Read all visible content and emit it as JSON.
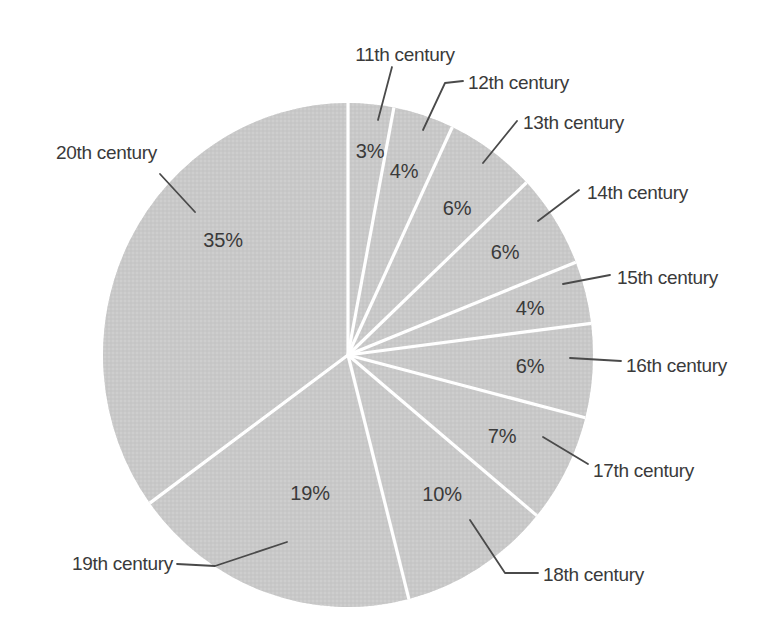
{
  "chart_data": {
    "type": "pie",
    "value_unit": "percent",
    "total": 100,
    "categories": [
      "11th century",
      "12th century",
      "13th century",
      "14th century",
      "15th century",
      "16th century",
      "17th century",
      "18th century",
      "19th century",
      "20th century"
    ],
    "values": [
      3,
      4,
      6,
      6,
      4,
      6,
      7,
      10,
      19,
      35
    ],
    "slices": [
      {
        "label": "11th century",
        "value": 3,
        "pct_text": "3%",
        "pct_pos": {
          "x": 370,
          "y": 151
        },
        "label_pos": {
          "x": 405,
          "y": 54,
          "anchor": "middle"
        },
        "leader": [
          [
            392,
            67
          ],
          [
            378,
            120
          ]
        ]
      },
      {
        "label": "12th century",
        "value": 4,
        "pct_text": "4%",
        "pct_pos": {
          "x": 404,
          "y": 171
        },
        "label_pos": {
          "x": 468,
          "y": 82,
          "anchor": "start"
        },
        "leader": [
          [
            463,
            81
          ],
          [
            445,
            83
          ],
          [
            423,
            130
          ]
        ]
      },
      {
        "label": "13th century",
        "value": 6,
        "pct_text": "6%",
        "pct_pos": {
          "x": 457,
          "y": 208
        },
        "label_pos": {
          "x": 523,
          "y": 122,
          "anchor": "start"
        },
        "leader": [
          [
            517,
            121
          ],
          [
            483,
            163
          ]
        ]
      },
      {
        "label": "14th century",
        "value": 6,
        "pct_text": "6%",
        "pct_pos": {
          "x": 505,
          "y": 252
        },
        "label_pos": {
          "x": 587,
          "y": 192,
          "anchor": "start"
        },
        "leader": [
          [
            579,
            190
          ],
          [
            538,
            221
          ]
        ]
      },
      {
        "label": "15th century",
        "value": 4,
        "pct_text": "4%",
        "pct_pos": {
          "x": 530,
          "y": 308
        },
        "label_pos": {
          "x": 617,
          "y": 277,
          "anchor": "start"
        },
        "leader": [
          [
            610,
            275
          ],
          [
            563,
            284
          ]
        ]
      },
      {
        "label": "16th century",
        "value": 6,
        "pct_text": "6%",
        "pct_pos": {
          "x": 530,
          "y": 366
        },
        "label_pos": {
          "x": 626,
          "y": 365,
          "anchor": "start"
        },
        "leader": [
          [
            621,
            361
          ],
          [
            570,
            358
          ]
        ]
      },
      {
        "label": "17th century",
        "value": 7,
        "pct_text": "7%",
        "pct_pos": {
          "x": 502,
          "y": 436
        },
        "label_pos": {
          "x": 593,
          "y": 470,
          "anchor": "start"
        },
        "leader": [
          [
            588,
            464
          ],
          [
            543,
            437
          ]
        ]
      },
      {
        "label": "18th century",
        "value": 10,
        "pct_text": "10%",
        "pct_pos": {
          "x": 442,
          "y": 494
        },
        "label_pos": {
          "x": 543,
          "y": 574,
          "anchor": "start"
        },
        "leader": [
          [
            538,
            573
          ],
          [
            505,
            573
          ],
          [
            470,
            520
          ]
        ]
      },
      {
        "label": "19th century",
        "value": 19,
        "pct_text": "19%",
        "pct_pos": {
          "x": 310,
          "y": 493
        },
        "label_pos": {
          "x": 173,
          "y": 563,
          "anchor": "end"
        },
        "leader": [
          [
            177,
            564
          ],
          [
            215,
            566
          ],
          [
            287,
            542
          ]
        ]
      },
      {
        "label": "20th century",
        "value": 35,
        "pct_text": "35%",
        "pct_pos": {
          "x": 223,
          "y": 240
        },
        "label_pos": {
          "x": 157,
          "y": 152,
          "anchor": "end"
        },
        "leader": [
          [
            160,
            174
          ],
          [
            195,
            212
          ]
        ]
      }
    ],
    "layout": {
      "canvas": {
        "width": 772,
        "height": 643
      },
      "center": {
        "x": 348,
        "y": 355
      },
      "radius_x": 245,
      "radius_y": 252,
      "start_angle_deg": 0,
      "direction": "clockwise",
      "legend": "none",
      "grid": false
    },
    "colors": {
      "slice_fill": "#c8c8c8",
      "texture_light": "#d3d3d3",
      "texture_dark": "#bebebe",
      "divider": "#ffffff",
      "leader_line": "#4a4a4a",
      "label_text": "#3a3a3a",
      "background": "#ffffff"
    }
  }
}
